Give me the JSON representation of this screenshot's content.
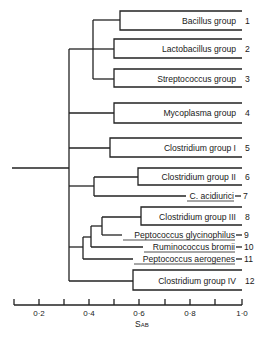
{
  "figure": {
    "type": "dendrogram",
    "axis": {
      "label": "SAB",
      "label_main": "S",
      "label_sub": "AB",
      "min": 0.1,
      "max": 1.0,
      "ticks": [
        0.2,
        0.3,
        0.4,
        0.5,
        0.6,
        0.7,
        0.8,
        0.9,
        1.0
      ],
      "tick_labels": [
        "0·2",
        "0·4",
        "0·6",
        "0·8",
        "1·0"
      ],
      "labeled_tick_values": [
        0.2,
        0.4,
        0.6,
        0.8,
        1.0
      ]
    },
    "leaves": [
      {
        "id": 1,
        "label": "Bacillus group",
        "number": "1",
        "style": "box",
        "box_left": 0.52
      },
      {
        "id": 2,
        "label": "Lactobacillus group",
        "number": "2",
        "style": "box",
        "box_left": 0.49
      },
      {
        "id": 3,
        "label": "Streptococcus group",
        "number": "3",
        "style": "box",
        "box_left": 0.49
      },
      {
        "id": 4,
        "label": "Mycoplasma group",
        "number": "4",
        "style": "box",
        "box_left": 0.49
      },
      {
        "id": 5,
        "label": "Clostridium group I",
        "number": "5",
        "style": "box",
        "box_left": 0.48
      },
      {
        "id": 6,
        "label": "Clostridium group II",
        "number": "6",
        "style": "box",
        "box_left": 0.59
      },
      {
        "id": 7,
        "label": "C. acidiurici",
        "number": "7",
        "style": "line",
        "underlined": true
      },
      {
        "id": 8,
        "label": "Clostridium group III",
        "number": "8",
        "style": "box",
        "box_left": 0.6
      },
      {
        "id": 9,
        "label": "Peptococcus glycinophilus",
        "number": "9",
        "style": "line",
        "underlined": true
      },
      {
        "id": 10,
        "label": "Ruminococcus bromii",
        "number": "10",
        "style": "line",
        "underlined": true
      },
      {
        "id": 11,
        "label": "Peptococcus aerogenes",
        "number": "11",
        "style": "line",
        "underlined": true
      },
      {
        "id": 12,
        "label": "Clostridium group IV",
        "number": "12",
        "style": "box",
        "box_left": 0.57
      }
    ],
    "joins": [
      {
        "members": [
          1,
          2,
          3
        ],
        "similarity": 0.41
      },
      {
        "members": [
          6,
          7
        ],
        "similarity": 0.42
      },
      {
        "members": [
          8,
          9
        ],
        "similarity": 0.45
      },
      {
        "members": [
          8,
          9,
          10
        ],
        "similarity": 0.4
      },
      {
        "members": [
          8,
          9,
          10,
          11
        ],
        "similarity": 0.37
      },
      {
        "members": [
          1,
          2,
          3,
          4,
          5,
          6,
          7,
          8,
          9,
          10,
          11,
          12
        ],
        "similarity": 0.32
      }
    ]
  }
}
